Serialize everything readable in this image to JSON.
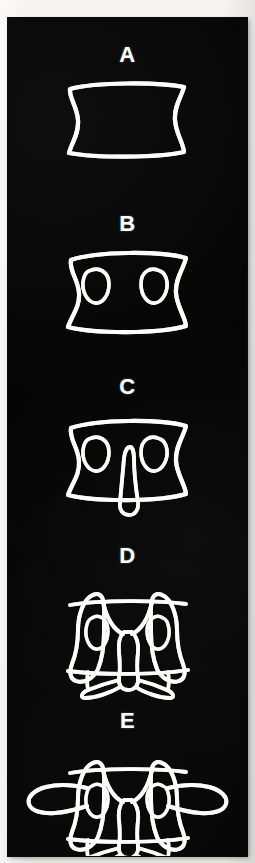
{
  "figure": {
    "panel_background_color": "#050505",
    "stroke_color": "#fdfdfb",
    "paper_color": "#f2f0ec",
    "orientation": "vertical-single-column",
    "stage_count": 5,
    "stages": [
      {
        "label": "A",
        "name": "vertebral-body",
        "description": "Vertebral body outline - rectangular block with concave lateral sides",
        "label_y": 26,
        "shape_y": 58,
        "shape_height": 92
      },
      {
        "label": "B",
        "name": "body-with-pedicles",
        "description": "Vertebral body with two oval pedicles added at upper left and upper right",
        "label_y": 195,
        "shape_y": 228,
        "shape_height": 96
      },
      {
        "label": "C",
        "name": "body-pedicles-spinous-process",
        "description": "Body with pedicles plus central tapering spinous process projecting downward",
        "label_y": 358,
        "shape_y": 396,
        "shape_height": 110
      },
      {
        "label": "D",
        "name": "with-articular-processes",
        "description": "Adds superior and inferior articular processes forming wing shapes and laminae",
        "label_y": 527,
        "shape_y": 556,
        "shape_height": 126
      },
      {
        "label": "E",
        "name": "complete-vertebra-with-transverse-processes",
        "description": "Complete vertebra with transverse processes extending laterally on both sides",
        "label_y": 692,
        "shape_y": 722,
        "shape_height": 128
      }
    ]
  },
  "panel": {
    "left": 8,
    "top": 18,
    "width": 239,
    "height": 838
  }
}
